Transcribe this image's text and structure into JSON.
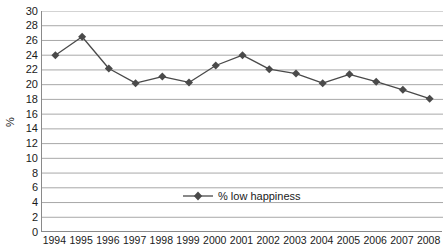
{
  "chart_data": {
    "type": "line",
    "title": "",
    "xlabel": "",
    "ylabel": "%",
    "categories": [
      "1994",
      "1995",
      "1996",
      "1997",
      "1998",
      "1999",
      "2000",
      "2001",
      "2002",
      "2003",
      "2004",
      "2005",
      "2006",
      "2007",
      "2008"
    ],
    "series": [
      {
        "name": "% low happiness",
        "values": [
          24.0,
          26.5,
          22.2,
          20.2,
          21.1,
          20.3,
          22.6,
          24.0,
          22.1,
          21.5,
          20.2,
          21.4,
          20.4,
          19.3,
          18.1
        ]
      }
    ],
    "ylim": [
      0,
      30
    ],
    "ytick_step": 2,
    "yticks": [
      "30",
      "28",
      "26",
      "24",
      "22",
      "20",
      "18",
      "16",
      "14",
      "12",
      "10",
      "8",
      "6",
      "4",
      "2",
      "0"
    ],
    "grid": "horizontal",
    "legend_position": "inside-bottom-center",
    "colors": {
      "series": "#4a4a4a",
      "grid": "#9e9e9e",
      "axis": "#8a8a8a",
      "text": "#1a1a1a",
      "background": "#ffffff"
    },
    "marker": "diamond"
  },
  "legend": {
    "entries": [
      {
        "label": "% low happiness"
      }
    ]
  },
  "axis": {
    "y_label": "%"
  }
}
